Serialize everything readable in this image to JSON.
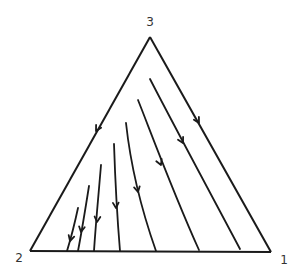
{
  "diagram": {
    "type": "simplex-phase-portrait",
    "vertices": [
      {
        "label": "3",
        "x": 150,
        "y": 37,
        "label_x": 150,
        "label_y": 26
      },
      {
        "label": "2",
        "x": 30,
        "y": 251,
        "label_x": 19,
        "label_y": 262
      },
      {
        "label": "1",
        "x": 271,
        "y": 252,
        "label_x": 284,
        "label_y": 264
      }
    ],
    "edges": [
      {
        "from": "3",
        "to": "2",
        "arrow": {
          "at": [
            96,
            131
          ],
          "dir": "toward-2"
        }
      },
      {
        "from": "3",
        "to": "1",
        "arrow": {
          "at": [
            199,
            123
          ],
          "dir": "toward-1"
        }
      },
      {
        "from": "2",
        "to": "1"
      }
    ],
    "trajectories": [
      {
        "d": "M150,79 C170,118 205,183 240,249",
        "arrow_at": [
          183,
          143
        ],
        "arrow_angle": 62
      },
      {
        "d": "M138,100 C150,130 172,190 199,250",
        "arrow_at": [
          161,
          165
        ],
        "arrow_angle": 67
      },
      {
        "d": "M126,123 C130,160 138,200 156,251",
        "arrow_at": [
          138,
          192
        ],
        "arrow_angle": 78
      },
      {
        "d": "M114,144 C115,175 117,215 120,251",
        "arrow_at": [
          116,
          208
        ],
        "arrow_angle": 87
      },
      {
        "d": "M101,165 C99,190 96,220 94,251",
        "arrow_at": [
          97,
          222
        ],
        "arrow_angle": 95
      },
      {
        "d": "M89,186 C86,205 82,230 78,251",
        "arrow_at": [
          81,
          232
        ],
        "arrow_angle": 100
      },
      {
        "d": "M78,208 C75,222 71,238 67,251",
        "arrow_at": [
          70,
          241
        ],
        "arrow_angle": 106
      }
    ]
  }
}
